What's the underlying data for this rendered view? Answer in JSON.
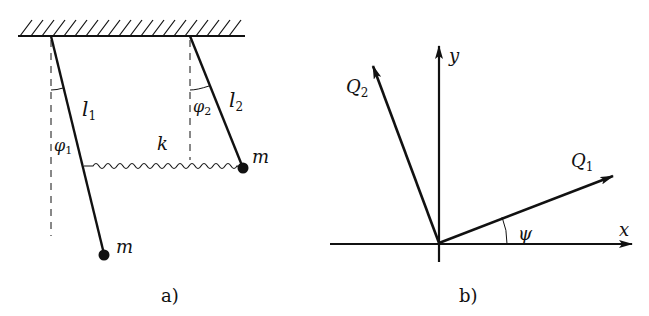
{
  "figure_a": {
    "caption": "a)",
    "labels": {
      "length1": "l",
      "length1_sub": "1",
      "length2": "l",
      "length2_sub": "2",
      "angle1": "φ",
      "angle1_sub": "1",
      "angle2": "φ",
      "angle2_sub": "2",
      "spring": "k",
      "mass_left": "m",
      "mass_right": "m"
    }
  },
  "figure_b": {
    "caption": "b)",
    "labels": {
      "x_axis": "x",
      "y_axis": "y",
      "q1": "Q",
      "q1_sub": "1",
      "q2": "Q",
      "q2_sub": "2",
      "angle": "ψ"
    }
  },
  "colors": {
    "ink": "#111111",
    "background": "#ffffff"
  }
}
